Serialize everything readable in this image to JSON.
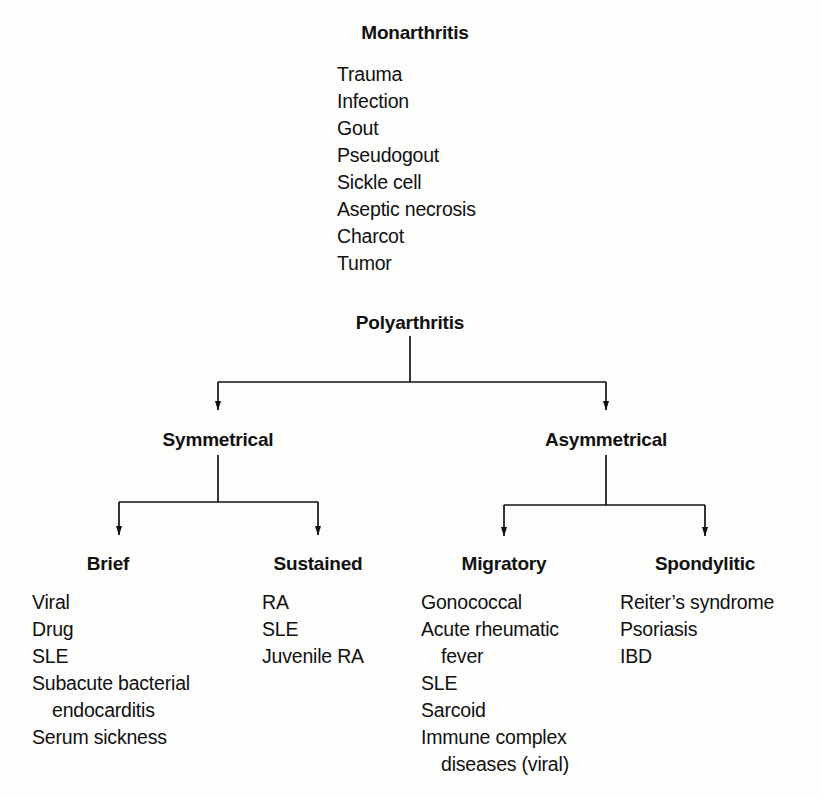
{
  "diagram": {
    "type": "tree",
    "stroke_color": "#111111",
    "background_color": "#fdfdfc"
  },
  "monarthritis": {
    "title": "Monarthritis",
    "items": [
      {
        "text": "Trauma",
        "continuation": false
      },
      {
        "text": "Infection",
        "continuation": false
      },
      {
        "text": "Gout",
        "continuation": false
      },
      {
        "text": "Pseudogout",
        "continuation": false
      },
      {
        "text": "Sickle cell",
        "continuation": false
      },
      {
        "text": "Aseptic necrosis",
        "continuation": false
      },
      {
        "text": "Charcot",
        "continuation": false
      },
      {
        "text": "Tumor",
        "continuation": false
      }
    ]
  },
  "polyarthritis": {
    "title": "Polyarthritis",
    "branches": {
      "symmetrical": {
        "title": "Symmetrical",
        "children": {
          "brief": {
            "title": "Brief",
            "items": [
              {
                "text": "Viral",
                "continuation": false
              },
              {
                "text": "Drug",
                "continuation": false
              },
              {
                "text": "SLE",
                "continuation": false
              },
              {
                "text": "Subacute bacterial",
                "continuation": false
              },
              {
                "text": "endocarditis",
                "continuation": true
              },
              {
                "text": "Serum sickness",
                "continuation": false
              }
            ]
          },
          "sustained": {
            "title": "Sustained",
            "items": [
              {
                "text": "RA",
                "continuation": false
              },
              {
                "text": "SLE",
                "continuation": false
              },
              {
                "text": "Juvenile RA",
                "continuation": false
              }
            ]
          }
        }
      },
      "asymmetrical": {
        "title": "Asymmetrical",
        "children": {
          "migratory": {
            "title": "Migratory",
            "items": [
              {
                "text": "Gonococcal",
                "continuation": false
              },
              {
                "text": "Acute rheumatic",
                "continuation": false
              },
              {
                "text": "fever",
                "continuation": true
              },
              {
                "text": "SLE",
                "continuation": false
              },
              {
                "text": "Sarcoid",
                "continuation": false
              },
              {
                "text": "Immune complex",
                "continuation": false
              },
              {
                "text": "diseases (viral)",
                "continuation": true
              }
            ]
          },
          "spondylitic": {
            "title": "Spondylitic",
            "items": [
              {
                "text": "Reiter’s syndrome",
                "continuation": false
              },
              {
                "text": "Psoriasis",
                "continuation": false
              },
              {
                "text": "IBD",
                "continuation": false
              }
            ]
          }
        }
      }
    }
  }
}
